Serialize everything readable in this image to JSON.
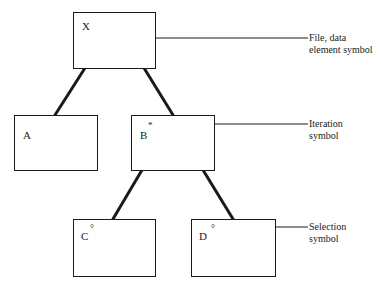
{
  "diagram": {
    "type": "structure-chart",
    "nodes": [
      {
        "id": "X",
        "label": "X",
        "symbol": "none"
      },
      {
        "id": "A",
        "label": "A",
        "symbol": "none"
      },
      {
        "id": "B",
        "label": "B",
        "symbol": "*"
      },
      {
        "id": "C",
        "label": "C",
        "symbol": "°"
      },
      {
        "id": "D",
        "label": "D",
        "symbol": "°"
      }
    ],
    "edges": [
      {
        "from": "X",
        "to": "A"
      },
      {
        "from": "X",
        "to": "B"
      },
      {
        "from": "B",
        "to": "C"
      },
      {
        "from": "B",
        "to": "D"
      }
    ],
    "annotations": [
      {
        "target": "X",
        "line1": "File, data",
        "line2": "element symbol"
      },
      {
        "target": "B",
        "line1": "Iteration",
        "line2": "symbol"
      },
      {
        "target": "D",
        "line1": "Selection",
        "line2": "symbol"
      }
    ]
  }
}
